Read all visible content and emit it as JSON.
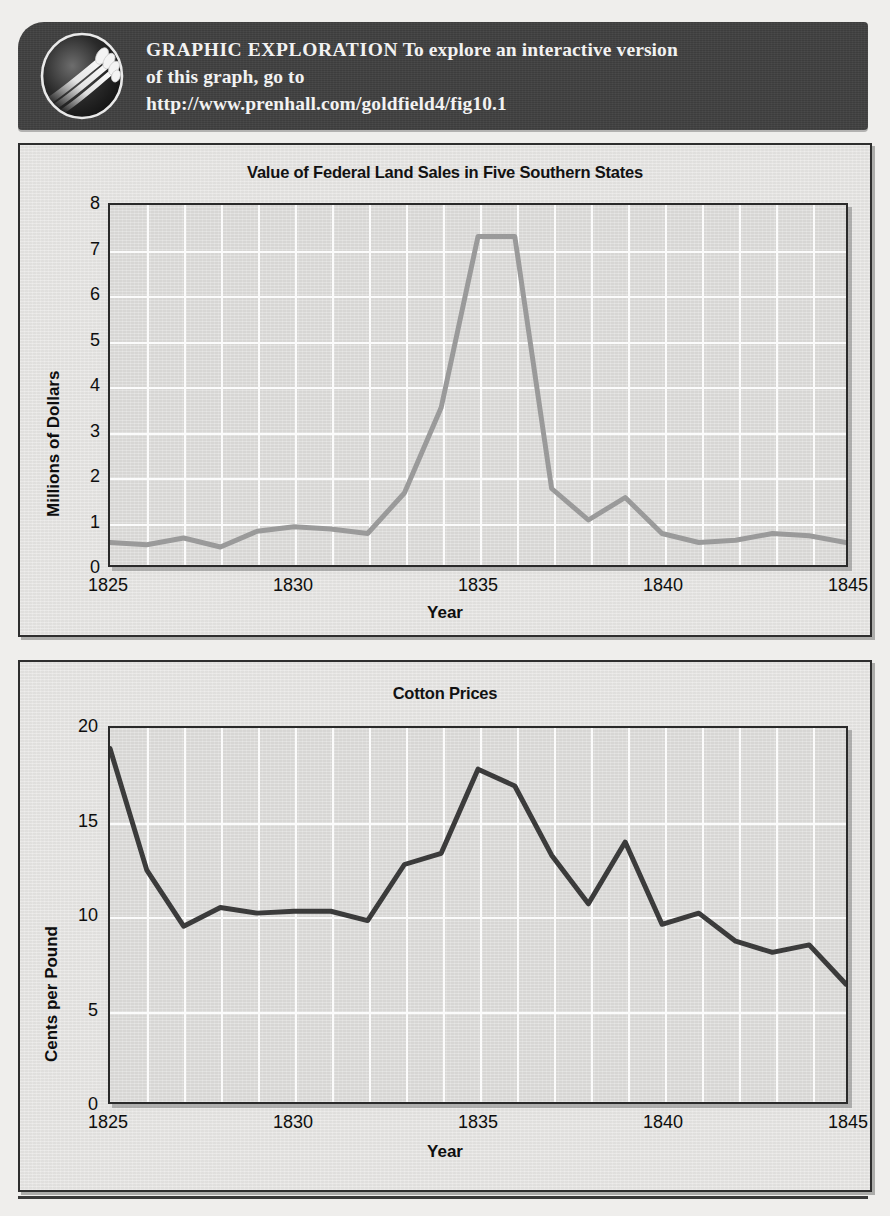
{
  "banner": {
    "icon_name": "globe-hand-icon",
    "label": "GRAPHIC  EXPLORATION",
    "line1_rest": " To explore an interactive version",
    "line2": "of this graph, go to",
    "url": "http://www.prenhall.com/goldfield4/fig10.1",
    "background_color": "#3f3f3f",
    "text_color": "#f2f2f2"
  },
  "page": {
    "background_color": "#efeeec",
    "panel_background": "#e6e5e3",
    "plot_background": "#dedddb",
    "gridline_color": "#fbfbfb",
    "axis_color": "#2a2a2a"
  },
  "chart_data": [
    {
      "id": "federal-land-sales",
      "type": "line",
      "title": "Value of Federal Land Sales in Five Southern States",
      "xlabel": "Year",
      "ylabel": "Millions of Dollars",
      "xlim": [
        1825,
        1845
      ],
      "ylim": [
        0,
        8
      ],
      "xticks": [
        1825,
        1830,
        1835,
        1840,
        1845
      ],
      "yticks": [
        0,
        1,
        2,
        3,
        4,
        5,
        6,
        7,
        8
      ],
      "grid": true,
      "legend": "none",
      "line_color": "#9a9a9a",
      "x": [
        1825,
        1826,
        1827,
        1828,
        1829,
        1830,
        1831,
        1832,
        1833,
        1834,
        1835,
        1836,
        1837,
        1838,
        1839,
        1840,
        1841,
        1842,
        1843,
        1844,
        1845
      ],
      "values": [
        0.5,
        0.45,
        0.6,
        0.4,
        0.75,
        0.85,
        0.8,
        0.7,
        1.6,
        3.5,
        7.3,
        7.3,
        1.7,
        1.0,
        1.5,
        0.7,
        0.5,
        0.55,
        0.7,
        0.65,
        0.5
      ]
    },
    {
      "id": "cotton-prices",
      "type": "line",
      "title": "Cotton Prices",
      "xlabel": "Year",
      "ylabel": "Cents per Pound",
      "xlim": [
        1825,
        1845
      ],
      "ylim": [
        0,
        20
      ],
      "xticks": [
        1825,
        1830,
        1835,
        1840,
        1845
      ],
      "yticks": [
        0,
        5,
        10,
        15,
        20
      ],
      "grid": true,
      "legend": "none",
      "line_color": "#3b3b3b",
      "x": [
        1825,
        1826,
        1827,
        1828,
        1829,
        1830,
        1831,
        1832,
        1833,
        1834,
        1835,
        1836,
        1837,
        1838,
        1839,
        1840,
        1841,
        1842,
        1843,
        1844,
        1845
      ],
      "values": [
        18.9,
        12.4,
        9.4,
        10.4,
        10.1,
        10.2,
        10.2,
        9.7,
        12.7,
        13.3,
        17.8,
        16.9,
        13.2,
        10.6,
        13.9,
        9.5,
        10.1,
        8.6,
        8.0,
        8.4,
        6.3
      ]
    }
  ]
}
